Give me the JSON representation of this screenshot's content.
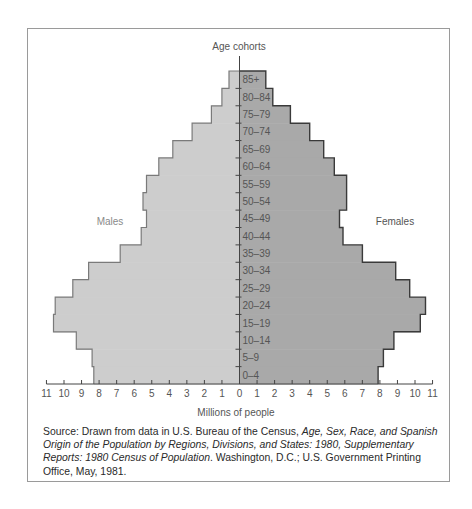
{
  "chart_data": {
    "type": "bar",
    "subtype": "population-pyramid",
    "title": "",
    "ylabel": "Age cohorts",
    "xlabel": "Millions of people",
    "categories": [
      "85+",
      "80-84",
      "75-79",
      "70-74",
      "65-69",
      "60-64",
      "55-59",
      "50-54",
      "45-49",
      "40-44",
      "35-39",
      "30-34",
      "25-29",
      "20-24",
      "15-19",
      "10-14",
      "5-9",
      "0-4"
    ],
    "series": [
      {
        "name": "Males",
        "color": "#cdcdcd",
        "values": [
          0.6,
          1.0,
          1.6,
          2.7,
          3.8,
          4.6,
          5.3,
          5.5,
          5.3,
          5.6,
          6.8,
          8.6,
          9.5,
          10.5,
          10.6,
          9.3,
          8.4,
          8.3
        ]
      },
      {
        "name": "Females",
        "color": "#a9a9a9",
        "values": [
          1.5,
          1.9,
          2.9,
          4.0,
          4.8,
          5.4,
          6.1,
          6.1,
          5.7,
          5.9,
          7.0,
          8.9,
          9.7,
          10.6,
          10.3,
          8.8,
          8.2,
          7.9
        ]
      }
    ],
    "xticks_left": [
      "11",
      "10",
      "9",
      "8",
      "7",
      "6",
      "5",
      "4",
      "3",
      "2",
      "1",
      "0"
    ],
    "xticks_right": [
      "1",
      "2",
      "3",
      "4",
      "5",
      "6",
      "7",
      "8",
      "9",
      "10",
      "11"
    ],
    "xlim": [
      -11,
      11
    ],
    "grid": false,
    "legend": "inline labels: Males (left), Females (right)"
  },
  "labels": {
    "axis_title": "Age cohorts",
    "x_axis_title": "Millions of people",
    "males": "Males",
    "females": "Females"
  },
  "caption": {
    "p1": "Source: Drawn from data in U.S. Bureau of the Census, ",
    "p2": "Age, Sex, Race, and Spanish Origin of the Population by Regions, Divisions, and States: 1980, Supplementary Reports: 1980 Census of Population",
    "p3": ". Washington, D.C.; U.S. Government Printing Office, May, 1981."
  }
}
